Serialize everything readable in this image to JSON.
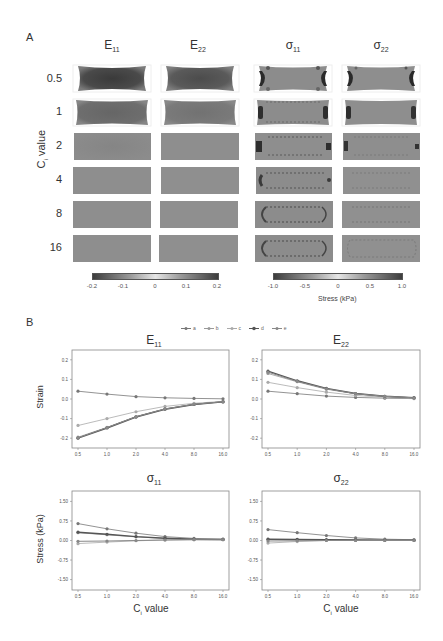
{
  "panel_a": {
    "letter": "A",
    "columns": [
      {
        "base": "E",
        "sub": "11"
      },
      {
        "base": "E",
        "sub": "22"
      },
      {
        "base": "σ",
        "sub": "11"
      },
      {
        "base": "σ",
        "sub": "22"
      }
    ],
    "ylabel_base": "C",
    "ylabel_sub": "i",
    "ylabel_rest": " value",
    "rows": [
      "0.5",
      "1",
      "2",
      "4",
      "8",
      "16"
    ],
    "strain_colorbar": {
      "ticks": [
        "-0.2",
        "-0.1",
        "0",
        "0.1",
        "0.2"
      ],
      "range": [
        -0.2,
        0.2
      ]
    },
    "stress_colorbar": {
      "ticks": [
        "-1.0",
        "-0.5",
        "0",
        "0.5",
        "1.0"
      ],
      "range": [
        -1.0,
        1.0
      ],
      "caption": "Stress (kPa)"
    }
  },
  "panel_b": {
    "letter": "B",
    "legend": [
      "a",
      "b",
      "c",
      "d",
      "e"
    ],
    "ylabel_strain": "Strain",
    "ylabel_stress": "Stress (kPa)",
    "xlabel_base": "C",
    "xlabel_sub": "i",
    "xlabel_rest": " value",
    "xticks": [
      "0.5",
      "1.0",
      "2.0",
      "4.0",
      "8.0",
      "16.0"
    ],
    "strain_yticks": [
      "0.2",
      "0.1",
      "0.0",
      "-0.1",
      "-0.2"
    ],
    "stress_yticks": [
      "1.50",
      "0.75",
      "0.00",
      "-0.75",
      "-1.50"
    ],
    "titles": [
      {
        "base": "E",
        "sub": "11"
      },
      {
        "base": "E",
        "sub": "22"
      },
      {
        "base": "σ",
        "sub": "11"
      },
      {
        "base": "σ",
        "sub": "22"
      }
    ]
  },
  "chart_data": [
    {
      "type": "heatmap",
      "title": "Panel A: spatial strain/stress maps vs C_i value",
      "columns": [
        "E11",
        "E22",
        "σ11",
        "σ22"
      ],
      "rows": [
        "0.5",
        "1",
        "2",
        "4",
        "8",
        "16"
      ],
      "ylabel": "C_i value",
      "colorbars": [
        {
          "label": "strain",
          "range": [
            -0.2,
            0.2
          ],
          "ticks": [
            -0.2,
            -0.1,
            0,
            0.1,
            0.2
          ]
        },
        {
          "label": "Stress (kPa)",
          "range": [
            -1.0,
            1.0
          ],
          "ticks": [
            -1.0,
            -0.5,
            0,
            0.5,
            1.0
          ]
        }
      ]
    },
    {
      "type": "line",
      "title": "E11",
      "xlabel": "",
      "ylabel": "Strain",
      "categories": [
        "0.5",
        "1.0",
        "2.0",
        "4.0",
        "8.0",
        "16.0"
      ],
      "ylim": [
        -0.25,
        0.25
      ],
      "series": [
        {
          "name": "a",
          "values": [
            0.04,
            0.025,
            0.012,
            0.006,
            0.003,
            0.001
          ]
        },
        {
          "name": "b",
          "values": [
            -0.135,
            -0.1,
            -0.065,
            -0.038,
            -0.022,
            -0.012
          ]
        },
        {
          "name": "c",
          "values": [
            -0.195,
            -0.145,
            -0.09,
            -0.05,
            -0.027,
            -0.014
          ]
        },
        {
          "name": "d",
          "values": [
            -0.2,
            -0.148,
            -0.092,
            -0.052,
            -0.028,
            -0.015
          ]
        },
        {
          "name": "e",
          "values": [
            -0.198,
            -0.146,
            -0.091,
            -0.051,
            -0.027,
            -0.014
          ]
        }
      ]
    },
    {
      "type": "line",
      "title": "E22",
      "xlabel": "",
      "ylabel": "",
      "categories": [
        "0.5",
        "1.0",
        "2.0",
        "4.0",
        "8.0",
        "16.0"
      ],
      "ylim": [
        -0.25,
        0.25
      ],
      "series": [
        {
          "name": "a",
          "values": [
            0.04,
            0.027,
            0.015,
            0.008,
            0.004,
            0.002
          ]
        },
        {
          "name": "b",
          "values": [
            0.085,
            0.058,
            0.035,
            0.018,
            0.009,
            0.004
          ]
        },
        {
          "name": "c",
          "values": [
            0.13,
            0.088,
            0.05,
            0.026,
            0.013,
            0.006
          ]
        },
        {
          "name": "d",
          "values": [
            0.142,
            0.093,
            0.054,
            0.028,
            0.014,
            0.007
          ]
        },
        {
          "name": "e",
          "values": [
            0.137,
            0.09,
            0.052,
            0.027,
            0.014,
            0.006
          ]
        }
      ]
    },
    {
      "type": "line",
      "title": "σ11",
      "xlabel": "C_i value",
      "ylabel": "Stress (kPa)",
      "categories": [
        "0.5",
        "1.0",
        "2.0",
        "4.0",
        "8.0",
        "16.0"
      ],
      "ylim": [
        -1.9,
        1.9
      ],
      "series": [
        {
          "name": "a",
          "values": [
            0.65,
            0.45,
            0.28,
            0.15,
            0.08,
            0.05
          ]
        },
        {
          "name": "b",
          "values": [
            -0.12,
            -0.06,
            -0.01,
            0.02,
            0.03,
            0.03
          ]
        },
        {
          "name": "c",
          "values": [
            0.3,
            0.22,
            0.14,
            0.08,
            0.05,
            0.04
          ]
        },
        {
          "name": "d",
          "values": [
            0.32,
            0.24,
            0.15,
            0.09,
            0.05,
            0.04
          ]
        },
        {
          "name": "e",
          "values": [
            -0.03,
            -0.02,
            0.0,
            0.02,
            0.03,
            0.03
          ]
        }
      ]
    },
    {
      "type": "line",
      "title": "σ22",
      "xlabel": "C_i value",
      "ylabel": "",
      "categories": [
        "0.5",
        "1.0",
        "2.0",
        "4.0",
        "8.0",
        "16.0"
      ],
      "ylim": [
        -1.9,
        1.9
      ],
      "series": [
        {
          "name": "a",
          "values": [
            0.42,
            0.3,
            0.19,
            0.1,
            0.05,
            0.03
          ]
        },
        {
          "name": "b",
          "values": [
            -0.1,
            -0.04,
            0.0,
            0.01,
            0.01,
            0.01
          ]
        },
        {
          "name": "c",
          "values": [
            0.04,
            0.03,
            0.02,
            0.01,
            0.01,
            0.01
          ]
        },
        {
          "name": "d",
          "values": [
            0.05,
            0.04,
            0.03,
            0.02,
            0.01,
            0.01
          ]
        },
        {
          "name": "e",
          "values": [
            -0.02,
            -0.01,
            0.0,
            0.0,
            0.0,
            0.0
          ]
        }
      ]
    }
  ]
}
